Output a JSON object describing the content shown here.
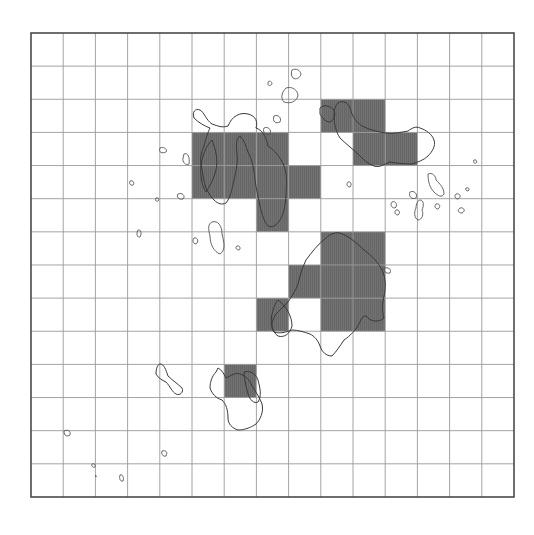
{
  "figure": {
    "title": "",
    "grid": {
      "origin_x": 31,
      "origin_y": 33,
      "columns": 15,
      "rows": 14,
      "cell_width": 32.2,
      "cell_height": 33.14,
      "line_color": "#9a9a9a",
      "frame_color": "#4a4a4a"
    },
    "shade_color": "#6e6e6e",
    "occupied_cells": [
      {
        "row": 2,
        "col": 9
      },
      {
        "row": 2,
        "col": 10
      },
      {
        "row": 3,
        "col": 5
      },
      {
        "row": 3,
        "col": 6
      },
      {
        "row": 3,
        "col": 7
      },
      {
        "row": 3,
        "col": 10
      },
      {
        "row": 3,
        "col": 11
      },
      {
        "row": 4,
        "col": 5
      },
      {
        "row": 4,
        "col": 6
      },
      {
        "row": 4,
        "col": 7
      },
      {
        "row": 4,
        "col": 8
      },
      {
        "row": 5,
        "col": 7
      },
      {
        "row": 6,
        "col": 9
      },
      {
        "row": 6,
        "col": 10
      },
      {
        "row": 7,
        "col": 8
      },
      {
        "row": 7,
        "col": 9
      },
      {
        "row": 7,
        "col": 10
      },
      {
        "row": 8,
        "col": 7
      },
      {
        "row": 8,
        "col": 9
      },
      {
        "row": 8,
        "col": 10
      },
      {
        "row": 10,
        "col": 6
      }
    ],
    "occupied_count": 21,
    "legend": ""
  }
}
